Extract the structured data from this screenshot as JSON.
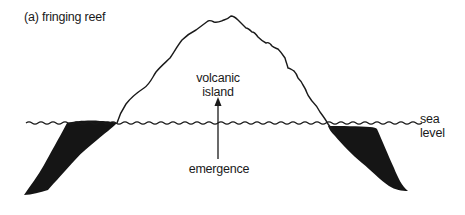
{
  "diagram": {
    "title": "(a) fringing reef",
    "labels": {
      "volcanic_island_line1": "volcanic",
      "volcanic_island_line2": "island",
      "emergence": "emergence",
      "sea_level_line1": "sea",
      "sea_level_line2": "level"
    },
    "elements": [
      {
        "id": "volcanic-island-outline",
        "type": "curve"
      },
      {
        "id": "sea-level-line",
        "type": "wavy-line"
      },
      {
        "id": "left-fringing-reef",
        "type": "filled-shape"
      },
      {
        "id": "right-fringing-reef",
        "type": "filled-shape"
      },
      {
        "id": "emergence-arrow",
        "type": "arrow",
        "direction": "up"
      }
    ],
    "colors": {
      "ink": "#1a1a1a",
      "reef_fill": "#151515",
      "background": "#ffffff"
    }
  }
}
